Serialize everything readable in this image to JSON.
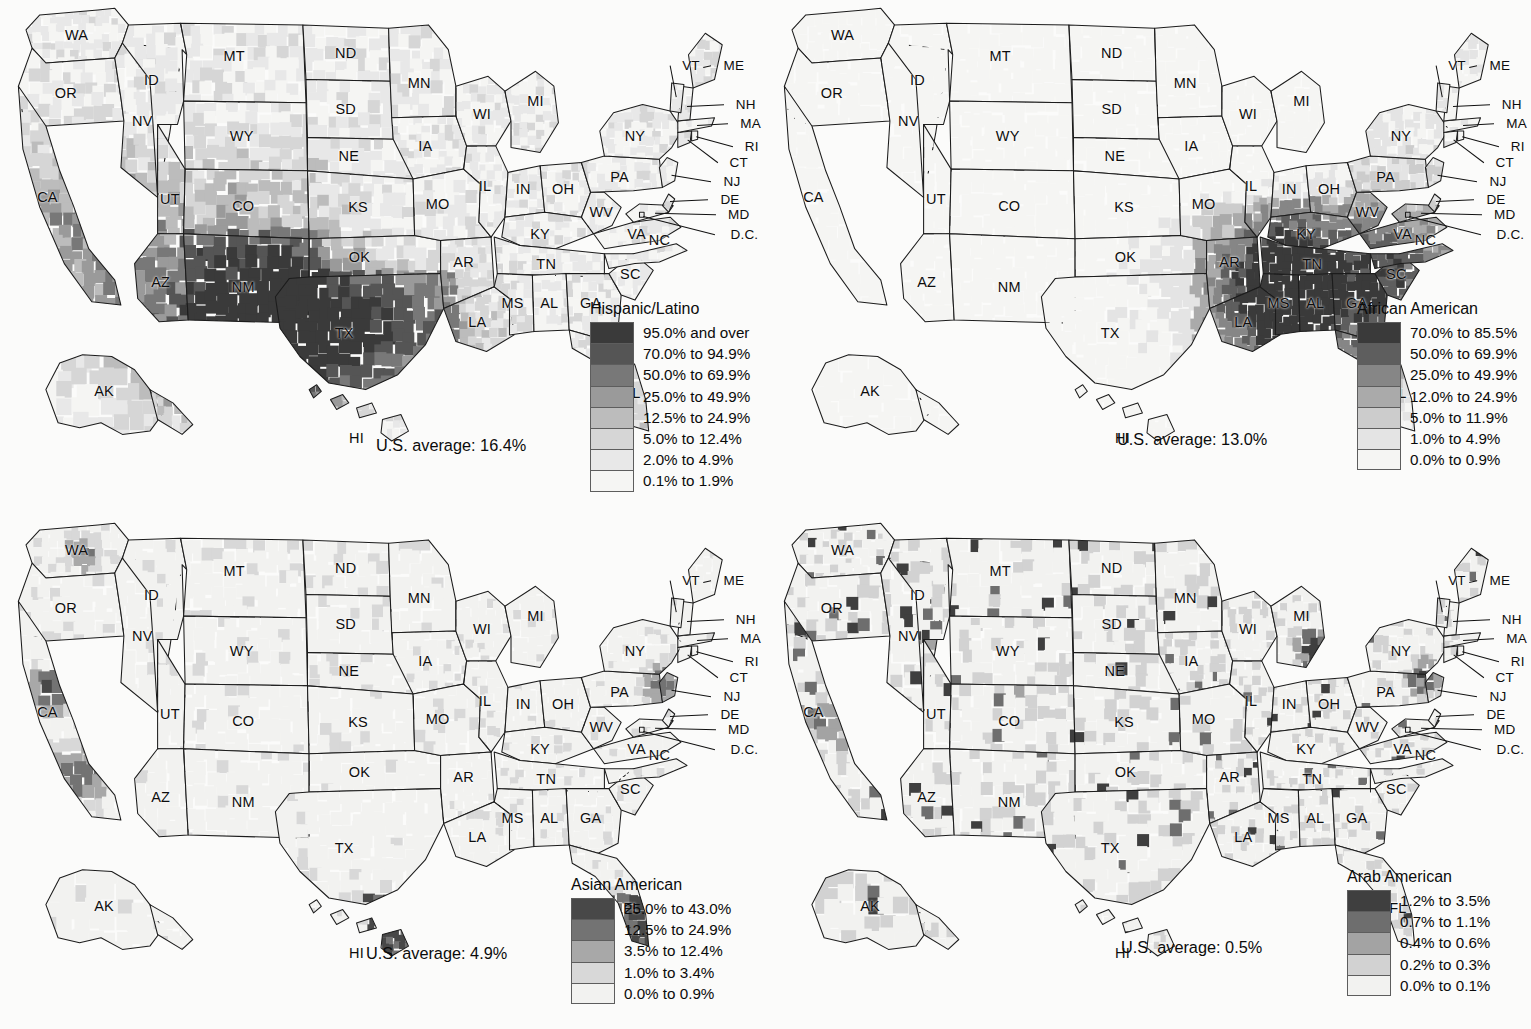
{
  "figure": {
    "type": "choropleth-map-grid",
    "rows": 2,
    "cols": 2,
    "geography": "United States counties",
    "background_color": "#fbfbfa"
  },
  "grayscale_ramp": [
    "#3a3a3a",
    "#555555",
    "#787878",
    "#9a9a9a",
    "#bcbcbc",
    "#d6d6d6",
    "#e8e8e8",
    "#f5f5f3"
  ],
  "state_labels": [
    "WA",
    "OR",
    "ID",
    "MT",
    "WY",
    "NV",
    "UT",
    "CA",
    "AZ",
    "NM",
    "CO",
    "ND",
    "SD",
    "NE",
    "KS",
    "OK",
    "TX",
    "MN",
    "IA",
    "MO",
    "AR",
    "LA",
    "WI",
    "IL",
    "MI",
    "IN",
    "OH",
    "KY",
    "TN",
    "MS",
    "AL",
    "GA",
    "FL",
    "SC",
    "NC",
    "VA",
    "WV",
    "MD",
    "DE",
    "NJ",
    "PA",
    "NY",
    "CT",
    "RI",
    "MA",
    "NH",
    "VT",
    "ME",
    "D.C.",
    "AK",
    "HI"
  ],
  "panels": [
    {
      "id": "hispanic-latino",
      "legend_title": "Hispanic/Latino",
      "us_average": "U.S. average: 16.4%",
      "us_average_value": 16.4,
      "classes": [
        {
          "label": "95.0% and over",
          "color": "#3a3a3a",
          "min": 95.0,
          "max": 100.0
        },
        {
          "label": "70.0% to 94.9%",
          "color": "#555555",
          "min": 70.0,
          "max": 94.9
        },
        {
          "label": "50.0% to 69.9%",
          "color": "#787878",
          "min": 50.0,
          "max": 69.9
        },
        {
          "label": "25.0% to 49.9%",
          "color": "#9a9a9a",
          "min": 25.0,
          "max": 49.9
        },
        {
          "label": "12.5% to 24.9%",
          "color": "#bcbcbc",
          "min": 12.5,
          "max": 24.9
        },
        {
          "label": "5.0% to 12.4%",
          "color": "#d6d6d6",
          "min": 5.0,
          "max": 12.4
        },
        {
          "label": "2.0% to 4.9%",
          "color": "#e8e8e8",
          "min": 2.0,
          "max": 4.9
        },
        {
          "label": "0.1% to 1.9%",
          "color": "#f5f5f3",
          "min": 0.1,
          "max": 1.9
        }
      ]
    },
    {
      "id": "african-american",
      "legend_title": "African American",
      "us_average": "U.S. average: 13.0%",
      "us_average_value": 13.0,
      "classes": [
        {
          "label": "70.0% to 85.5%",
          "color": "#3a3a3a",
          "min": 70.0,
          "max": 85.5
        },
        {
          "label": "50.0% to 69.9%",
          "color": "#5e5e5e",
          "min": 50.0,
          "max": 69.9
        },
        {
          "label": "25.0% to 49.9%",
          "color": "#868686",
          "min": 25.0,
          "max": 49.9
        },
        {
          "label": "12.0% to 24.9%",
          "color": "#aaaaaa",
          "min": 12.0,
          "max": 24.9
        },
        {
          "label": "5.0% to 11.9%",
          "color": "#cccccc",
          "min": 5.0,
          "max": 11.9
        },
        {
          "label": "1.0% to 4.9%",
          "color": "#e4e4e4",
          "min": 1.0,
          "max": 4.9
        },
        {
          "label": "0.0% to 0.9%",
          "color": "#f5f5f3",
          "min": 0.0,
          "max": 0.9
        }
      ]
    },
    {
      "id": "asian-american",
      "legend_title": "Asian American",
      "us_average": "U.S. average: 4.9%",
      "us_average_value": 4.9,
      "classes": [
        {
          "label": "25.0% to 43.0%",
          "color": "#484848",
          "min": 25.0,
          "max": 43.0
        },
        {
          "label": "12.5% to 24.9%",
          "color": "#737373",
          "min": 12.5,
          "max": 24.9
        },
        {
          "label": "3.5% to 12.4%",
          "color": "#a8a8a8",
          "min": 3.5,
          "max": 12.4
        },
        {
          "label": "1.0% to 3.4%",
          "color": "#d8d8d8",
          "min": 1.0,
          "max": 3.4
        },
        {
          "label": "0.0% to 0.9%",
          "color": "#f2f2f0",
          "min": 0.0,
          "max": 0.9
        }
      ]
    },
    {
      "id": "arab-american",
      "legend_title": "Arab American",
      "us_average": "U.S. average: 0.5%",
      "us_average_value": 0.5,
      "classes": [
        {
          "label": "1.2% to 3.5%",
          "color": "#3f3f3f",
          "min": 1.2,
          "max": 3.5
        },
        {
          "label": "0.7% to 1.1%",
          "color": "#6e6e6e",
          "min": 0.7,
          "max": 1.1
        },
        {
          "label": "0.4% to 0.6%",
          "color": "#a3a3a3",
          "min": 0.4,
          "max": 0.6
        },
        {
          "label": "0.2% to 0.3%",
          "color": "#d2d2d2",
          "min": 0.2,
          "max": 0.3
        },
        {
          "label": "0.0% to 0.1%",
          "color": "#f2f2f0",
          "min": 0.0,
          "max": 0.1
        }
      ]
    }
  ]
}
